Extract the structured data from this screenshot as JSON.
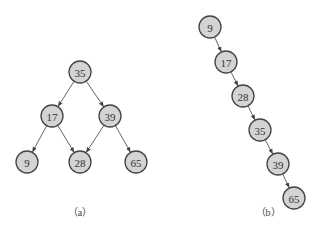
{
  "diagram_a": {
    "caption": "（a）",
    "nodes": [
      {
        "id": "35",
        "label": "35",
        "x": 80,
        "y": 72
      },
      {
        "id": "17",
        "label": "17",
        "x": 52,
        "y": 116
      },
      {
        "id": "39",
        "label": "39",
        "x": 110,
        "y": 116
      },
      {
        "id": "9",
        "label": "9",
        "x": 27,
        "y": 162
      },
      {
        "id": "28",
        "label": "28",
        "x": 80,
        "y": 162
      },
      {
        "id": "65",
        "label": "65",
        "x": 136,
        "y": 162
      }
    ],
    "edges": [
      [
        "35",
        "17"
      ],
      [
        "35",
        "39"
      ],
      [
        "17",
        "9"
      ],
      [
        "17",
        "28"
      ],
      [
        "39",
        "28"
      ],
      [
        "39",
        "65"
      ]
    ]
  },
  "diagram_b": {
    "caption": "（b）",
    "nodes": [
      {
        "id": "9",
        "label": "9",
        "x": 210,
        "y": 27
      },
      {
        "id": "17",
        "label": "17",
        "x": 226,
        "y": 62
      },
      {
        "id": "28",
        "label": "28",
        "x": 243,
        "y": 96
      },
      {
        "id": "35",
        "label": "35",
        "x": 260,
        "y": 130
      },
      {
        "id": "39",
        "label": "39",
        "x": 278,
        "y": 164
      },
      {
        "id": "65",
        "label": "65",
        "x": 294,
        "y": 198
      }
    ],
    "edges": [
      [
        "9",
        "17"
      ],
      [
        "17",
        "28"
      ],
      [
        "28",
        "35"
      ],
      [
        "35",
        "39"
      ],
      [
        "39",
        "65"
      ]
    ]
  },
  "style": {
    "node_fill": "#d4d4d4",
    "node_stroke": "#444444",
    "edge_color": "#555555",
    "node_radius": 11
  }
}
